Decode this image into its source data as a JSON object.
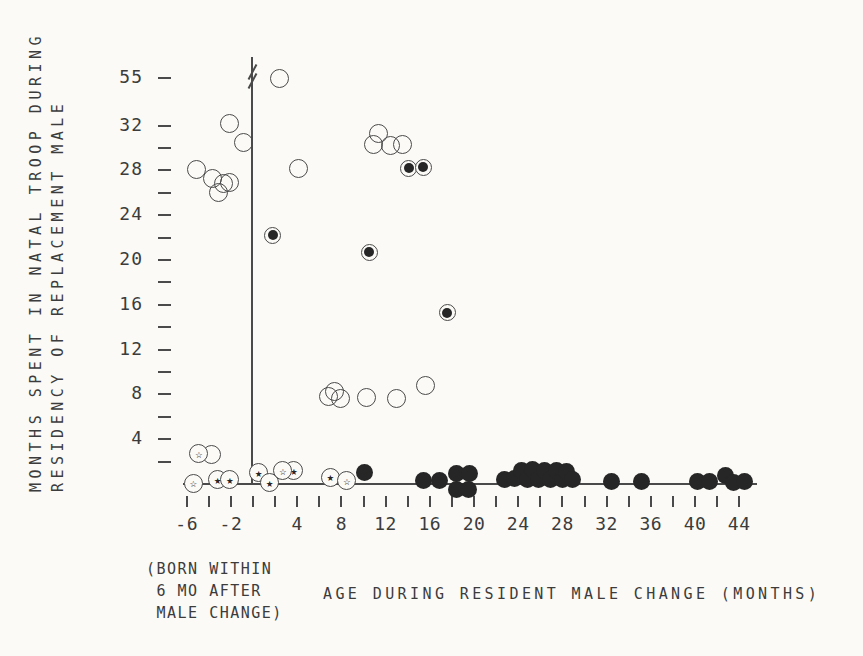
{
  "figure": {
    "bg_color": "#fbfaf7",
    "ink_color": "#3c3c3c",
    "point_color": "#262626"
  },
  "y_axis": {
    "title_line1": "MONTHS SPENT IN NATAL TROOP DURING",
    "title_line2": "RESIDENCY OF REPLACEMENT MALE",
    "labeled_ticks": [
      55,
      32,
      28,
      24,
      20,
      16,
      12,
      8,
      4
    ],
    "unlabeled_ticks": [
      30,
      26,
      22,
      18,
      14,
      10,
      6,
      2
    ],
    "break_between": [
      32,
      55
    ]
  },
  "x_axis": {
    "title": "AGE DURING RESIDENT MALE CHANGE (MONTHS)",
    "note_line1": "(BORN WITHIN",
    "note_line2": " 6 MO AFTER",
    "note_line3": " MALE CHANGE)",
    "labeled_ticks": [
      -6,
      -2,
      4,
      8,
      12,
      16,
      20,
      24,
      28,
      32,
      36,
      40,
      44
    ],
    "tick_step": 2,
    "tick_range": [
      -6,
      44
    ]
  },
  "chart_data": {
    "type": "scatter",
    "title": "",
    "xlabel": "AGE DURING RESIDENT MALE CHANGE (MONTHS)",
    "ylabel": "MONTHS SPENT IN NATAL TROOP DURING RESIDENCY OF REPLACEMENT MALE",
    "xlim": [
      -8,
      46
    ],
    "ylim": [
      0,
      34
    ],
    "y_break": {
      "after_value": 32,
      "resumes_at": 55
    },
    "grid": false,
    "legend": "none",
    "series": [
      {
        "name": "open-circle",
        "marker": "open-circle",
        "points": [
          [
            2.4,
            55
          ],
          [
            -2.1,
            32.2
          ],
          [
            -0.9,
            30.5
          ],
          [
            -5.1,
            28.1
          ],
          [
            -3.7,
            27.3
          ],
          [
            -3.1,
            26.0
          ],
          [
            -2.7,
            26.8
          ],
          [
            -2.1,
            26.9
          ],
          [
            4.1,
            28.2
          ],
          [
            10.9,
            30.3
          ],
          [
            11.4,
            31.3
          ],
          [
            12.4,
            30.2
          ],
          [
            13.5,
            30.3
          ],
          [
            -3.8,
            2.6
          ],
          [
            6.8,
            7.8
          ],
          [
            7.4,
            8.3
          ],
          [
            7.9,
            7.6
          ],
          [
            10.3,
            7.7
          ],
          [
            13.0,
            7.6
          ],
          [
            15.6,
            8.8
          ]
        ]
      },
      {
        "name": "filled-circle",
        "marker": "filled-circle",
        "points": [
          [
            10.1,
            1.0
          ],
          [
            15.4,
            0.3
          ],
          [
            16.9,
            0.3
          ],
          [
            18.4,
            0.9
          ],
          [
            19.6,
            0.9
          ],
          [
            18.4,
            -0.5
          ],
          [
            19.5,
            -0.5
          ],
          [
            22.8,
            0.4
          ],
          [
            23.7,
            0.5
          ],
          [
            24.3,
            1.2
          ],
          [
            24.8,
            0.4
          ],
          [
            25.3,
            1.3
          ],
          [
            25.8,
            0.4
          ],
          [
            26.4,
            1.2
          ],
          [
            26.9,
            0.4
          ],
          [
            27.5,
            1.2
          ],
          [
            28.0,
            0.4
          ],
          [
            28.4,
            1.1
          ],
          [
            28.9,
            0.4
          ],
          [
            32.4,
            0.2
          ],
          [
            35.2,
            0.2
          ],
          [
            40.2,
            0.2
          ],
          [
            41.3,
            0.2
          ],
          [
            42.8,
            0.8
          ],
          [
            43.5,
            0.1
          ],
          [
            44.5,
            0.2
          ]
        ]
      },
      {
        "name": "circled-dot",
        "marker": "circled-dot",
        "points": [
          [
            1.8,
            22.2
          ],
          [
            14.1,
            28.2
          ],
          [
            15.4,
            28.3
          ],
          [
            10.5,
            20.7
          ],
          [
            17.6,
            15.3
          ]
        ]
      },
      {
        "name": "circle-filled-star",
        "marker": "circle-filled-star",
        "glyph": "★",
        "points": [
          [
            -3.2,
            0.4
          ],
          [
            -2.1,
            0.4
          ],
          [
            0.5,
            1.0
          ],
          [
            1.5,
            0.1
          ],
          [
            3.7,
            1.2
          ],
          [
            7.0,
            0.6
          ]
        ]
      },
      {
        "name": "circle-open-star",
        "marker": "circle-open-star",
        "glyph": "☆",
        "points": [
          [
            -5.4,
            0.05
          ],
          [
            -4.9,
            2.7
          ],
          [
            2.7,
            1.2
          ],
          [
            8.5,
            0.3
          ]
        ]
      }
    ]
  }
}
